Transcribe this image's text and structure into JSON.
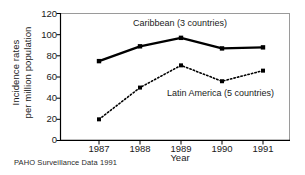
{
  "chart_data": {
    "type": "line",
    "title": "",
    "xlabel": "Year",
    "ylabel_line1": "Incidence rates",
    "ylabel_line2": "per million population",
    "categories": [
      "1987",
      "1988",
      "1989",
      "1990",
      "1991"
    ],
    "x": [
      1987,
      1988,
      1989,
      1990,
      1991
    ],
    "xlim": [
      1986.05,
      1991.7
    ],
    "ylim": [
      0,
      120
    ],
    "yticks": [
      "0",
      "20",
      "40",
      "60",
      "80",
      "100",
      "120"
    ],
    "ytick_values": [
      0,
      20,
      40,
      60,
      80,
      100,
      120
    ],
    "grid": false,
    "legend_position": "inline-annotations",
    "series": [
      {
        "name": "Caribbean (3 countries)",
        "values": [
          75,
          89,
          97,
          87,
          88
        ],
        "line_style": "solid",
        "color": "#000000",
        "marker": "square"
      },
      {
        "name": "Latin America (5 countries)",
        "values": [
          20,
          50,
          71,
          56,
          66
        ],
        "line_style": "dotted",
        "color": "#000000",
        "marker": "square"
      }
    ],
    "annotations": [
      {
        "text": "Caribbean (3 countries)"
      },
      {
        "text": "Latin America (5 countries)"
      }
    ],
    "source_note": "PAHO Surveillance Data 1991",
    "colors": {
      "axis": "#000000",
      "frame": "#9a9a9a",
      "series_1": "#000000",
      "series_2": "#000000",
      "background": "#ffffff"
    }
  }
}
